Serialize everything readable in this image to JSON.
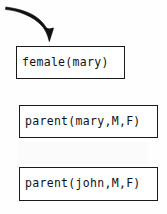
{
  "diagram": {
    "background_color": "#fefefe",
    "box_border_color": "#1a1a1a",
    "text_color": "#111111",
    "arrow_color": "#111111",
    "boxes": [
      {
        "id": "female-mary",
        "text": "female(mary)",
        "predicate": "female",
        "arguments": "mary"
      },
      {
        "id": "parent-mary",
        "text": "parent(mary,M,F)",
        "predicate": "parent",
        "arguments": "mary,M,F"
      },
      {
        "id": "parent-john",
        "text": "parent(john,M,F)",
        "predicate": "parent",
        "arguments": "john,M,F"
      }
    ],
    "arrow": {
      "name": "curved-pointer-arrow",
      "points_to": "female(mary)",
      "direction": "down-right"
    }
  }
}
